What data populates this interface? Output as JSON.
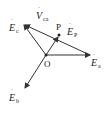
{
  "diagram": {
    "type": "phasor-diagram",
    "origin_label": "O",
    "point_label": "P",
    "vectors": {
      "Ea": {
        "symbol": "E",
        "subscript": "a"
      },
      "Eb": {
        "symbol": "E",
        "subscript": "b"
      },
      "Ec": {
        "symbol": "E",
        "subscript": "c"
      },
      "Ep": {
        "symbol": "E",
        "subscript": "P"
      },
      "Vca": {
        "symbol": "V",
        "subscript": "ca"
      }
    },
    "colors": {
      "line": "#333333",
      "background": "#ffffff"
    }
  }
}
